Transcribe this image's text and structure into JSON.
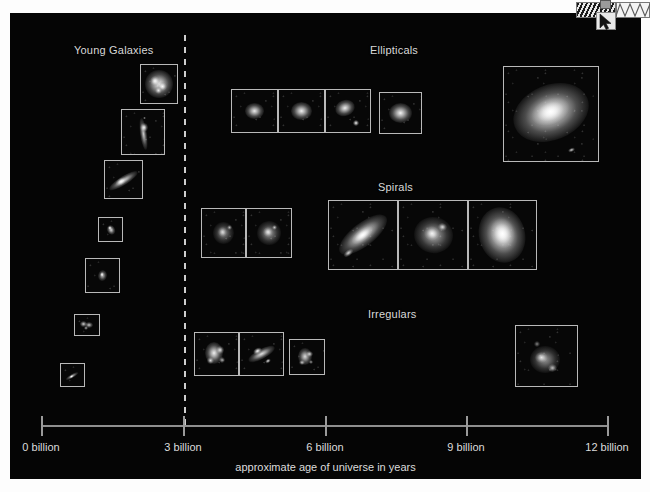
{
  "figure": {
    "background_color": "#050505",
    "page_background": "#fdfdfd"
  },
  "sections": [
    {
      "key": "young",
      "label": "Young Galaxies",
      "x": 74,
      "y": 44
    },
    {
      "key": "ellipticals",
      "label": "Ellipticals",
      "x": 370,
      "y": 44
    },
    {
      "key": "spirals",
      "label": "Spirals",
      "x": 378,
      "y": 181
    },
    {
      "key": "irregulars",
      "label": "Irregulars",
      "x": 368,
      "y": 308
    }
  ],
  "divider": {
    "name": "dashed-epoch-divider",
    "x": 184,
    "top": 35,
    "bottom": 428,
    "style": "dashed",
    "color": "#cfcfcf"
  },
  "axis": {
    "caption": "approximate age of universe in years",
    "line_color": "#8f8f8f",
    "start_x": 41,
    "end_x": 607,
    "y": 425,
    "ticks": [
      {
        "label": "0 billion",
        "value": 0,
        "x": 41
      },
      {
        "label": "3 billion",
        "value": 3,
        "x": 183
      },
      {
        "label": "6 billion",
        "value": 6,
        "x": 325
      },
      {
        "label": "9 billion",
        "value": 9,
        "x": 466
      },
      {
        "label": "12 billion",
        "value": 12,
        "x": 607
      }
    ],
    "unit": "billion years"
  },
  "chart_data": {
    "type": "scatter",
    "xlabel": "approximate age of universe in years",
    "ylabel": "",
    "xlim": [
      0,
      12
    ],
    "xticks": [
      0,
      3,
      6,
      9,
      12
    ],
    "xticklabels": [
      "0 billion",
      "3 billion",
      "6 billion",
      "9 billion",
      "12 billion"
    ],
    "grid": false,
    "legend": "none",
    "annotations": [
      "Young Galaxies",
      "Ellipticals",
      "Spirals",
      "Irregulars"
    ],
    "series": [
      {
        "name": "Young Galaxies",
        "note": "descending staircase of seven Hubble thumbnails left of the 3-billion-year divider",
        "points": [
          {
            "age": 2.26,
            "count": 1
          },
          {
            "age": 1.88,
            "count": 1
          },
          {
            "age": 1.66,
            "count": 1
          },
          {
            "age": 1.22,
            "count": 1
          },
          {
            "age": 0.97,
            "count": 1
          },
          {
            "age": 0.67,
            "count": 1
          },
          {
            "age": 0.42,
            "count": 1
          }
        ]
      },
      {
        "name": "Ellipticals",
        "note": "four thumbnails near 5-7 billion years plus one large close-up near 11 billion years",
        "points": [
          {
            "age": 5.1,
            "count": 3
          },
          {
            "age": 6.4,
            "count": 1
          },
          {
            "age": 9.7,
            "count": 1
          }
        ]
      },
      {
        "name": "Spirals",
        "note": "two small thumbnails near 4 billion years and three large thumbnails near 7-9 billion years",
        "points": [
          {
            "age": 4.1,
            "count": 2
          },
          {
            "age": 8.1,
            "count": 3
          }
        ]
      },
      {
        "name": "Irregulars",
        "note": "three thumbnails near 4 billion years and one near 10.5 billion years",
        "points": [
          {
            "age": 3.9,
            "count": 3
          },
          {
            "age": 10.5,
            "count": 1
          }
        ]
      }
    ]
  },
  "galaxies": [
    {
      "name": "young-galaxy-1",
      "group": "young",
      "x": 140,
      "y": 64,
      "w": 38,
      "h": 40,
      "shape": "clumpy",
      "bright": 0.95,
      "size": 0.62,
      "rot": 0
    },
    {
      "name": "young-galaxy-2",
      "group": "young",
      "x": 121,
      "y": 109,
      "w": 44,
      "h": 46,
      "shape": "filament",
      "bright": 0.78,
      "size": 0.5,
      "rot": -8
    },
    {
      "name": "young-galaxy-3",
      "group": "young",
      "x": 104,
      "y": 160,
      "w": 39,
      "h": 39,
      "shape": "streak",
      "bright": 0.88,
      "size": 0.58,
      "rot": -32
    },
    {
      "name": "young-galaxy-4",
      "group": "young",
      "x": 98,
      "y": 217,
      "w": 25,
      "h": 25,
      "shape": "knot",
      "bright": 0.85,
      "size": 0.48,
      "rot": -25
    },
    {
      "name": "young-galaxy-5",
      "group": "young",
      "x": 85,
      "y": 258,
      "w": 35,
      "h": 35,
      "shape": "knot",
      "bright": 0.72,
      "size": 0.38,
      "rot": 10
    },
    {
      "name": "young-galaxy-6",
      "group": "young",
      "x": 74,
      "y": 314,
      "w": 26,
      "h": 22,
      "shape": "pair",
      "bright": 0.8,
      "size": 0.55,
      "rot": 0
    },
    {
      "name": "young-galaxy-7",
      "group": "young",
      "x": 60,
      "y": 363,
      "w": 25,
      "h": 24,
      "shape": "streak",
      "bright": 0.7,
      "size": 0.4,
      "rot": -30
    },
    {
      "name": "elliptical-1",
      "group": "ellipticals",
      "x": 231,
      "y": 89,
      "w": 47,
      "h": 44,
      "shape": "ellipse",
      "bright": 0.92,
      "size": 0.42,
      "rot": 0
    },
    {
      "name": "elliptical-2",
      "group": "ellipticals",
      "x": 278,
      "y": 89,
      "w": 47,
      "h": 44,
      "shape": "ellipse",
      "bright": 0.95,
      "size": 0.46,
      "rot": 0
    },
    {
      "name": "elliptical-3",
      "group": "ellipticals",
      "x": 325,
      "y": 89,
      "w": 46,
      "h": 44,
      "shape": "ellipse-companion",
      "bright": 0.93,
      "size": 0.44,
      "rot": -20
    },
    {
      "name": "elliptical-4",
      "group": "ellipticals",
      "x": 379,
      "y": 92,
      "w": 43,
      "h": 42,
      "shape": "ellipse",
      "bright": 0.96,
      "size": 0.55,
      "rot": 0
    },
    {
      "name": "elliptical-large",
      "group": "ellipticals",
      "x": 503,
      "y": 66,
      "w": 96,
      "h": 96,
      "shape": "ellipse-large",
      "bright": 1.0,
      "size": 0.52,
      "rot": -22
    },
    {
      "name": "spiral-small-1",
      "group": "spirals",
      "x": 201,
      "y": 208,
      "w": 45,
      "h": 50,
      "shape": "spiral",
      "bright": 0.72,
      "size": 0.4,
      "rot": 0
    },
    {
      "name": "spiral-small-2",
      "group": "spirals",
      "x": 246,
      "y": 208,
      "w": 46,
      "h": 50,
      "shape": "spiral",
      "bright": 0.8,
      "size": 0.44,
      "rot": 15
    },
    {
      "name": "spiral-large-1",
      "group": "spirals",
      "x": 328,
      "y": 200,
      "w": 70,
      "h": 70,
      "shape": "spiral-edge",
      "bright": 0.96,
      "size": 0.5,
      "rot": -38
    },
    {
      "name": "spiral-large-2",
      "group": "spirals",
      "x": 398,
      "y": 200,
      "w": 70,
      "h": 70,
      "shape": "spiral",
      "bright": 0.9,
      "size": 0.46,
      "rot": 12
    },
    {
      "name": "spiral-large-3",
      "group": "spirals",
      "x": 468,
      "y": 200,
      "w": 69,
      "h": 70,
      "shape": "spiral-face",
      "bright": 1.0,
      "size": 0.54,
      "rot": -15
    },
    {
      "name": "irregular-1",
      "group": "irregulars",
      "x": 194,
      "y": 332,
      "w": 45,
      "h": 44,
      "shape": "irregular",
      "bright": 0.94,
      "size": 0.5,
      "rot": 0
    },
    {
      "name": "irregular-2",
      "group": "irregulars",
      "x": 239,
      "y": 332,
      "w": 45,
      "h": 44,
      "shape": "irregular-streak",
      "bright": 0.88,
      "size": 0.44,
      "rot": -28
    },
    {
      "name": "irregular-3",
      "group": "irregulars",
      "x": 289,
      "y": 339,
      "w": 36,
      "h": 36,
      "shape": "irregular",
      "bright": 0.85,
      "size": 0.48,
      "rot": 0
    },
    {
      "name": "irregular-4",
      "group": "irregulars",
      "x": 515,
      "y": 325,
      "w": 63,
      "h": 62,
      "shape": "irregular-diffuse",
      "bright": 0.82,
      "size": 0.42,
      "rot": 0
    }
  ],
  "artifact": {
    "name": "scrollbar-cursor-artifact",
    "description": "hatched strip, triangle-wave strip and mouse pointer overlapping the top-right corner"
  }
}
